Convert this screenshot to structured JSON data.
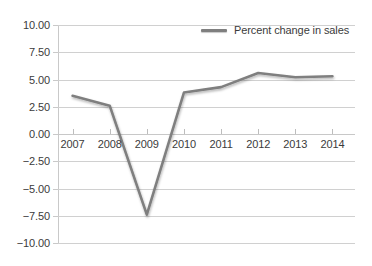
{
  "chart_data": {
    "type": "line",
    "title": "",
    "xlabel": "",
    "ylabel": "",
    "categories": [
      "2007",
      "2008",
      "2009",
      "2010",
      "2011",
      "2012",
      "2013",
      "2014"
    ],
    "series": [
      {
        "name": "Percent change in sales",
        "color": "#7f7f7f",
        "values": [
          3.5,
          2.6,
          -7.4,
          3.8,
          4.3,
          5.6,
          5.2,
          5.3
        ]
      }
    ],
    "ylim": [
      -10.0,
      10.0
    ],
    "ytick_step": 2.5,
    "ytick_labels": [
      "10.00",
      "7.50",
      "5.00",
      "2.50",
      "0.00",
      "-2.50",
      "-5.00",
      "-7.50",
      "-10.00"
    ],
    "ytick_values": [
      10.0,
      7.5,
      5.0,
      2.5,
      0.0,
      -2.5,
      -5.0,
      -7.5,
      -10.0
    ],
    "grid": true,
    "legend_position": "top-right",
    "legend_entries": [
      "Percent change in sales"
    ]
  },
  "legend": {
    "label": "Percent change in sales"
  },
  "colors": {
    "line": "#7f7f7f",
    "grid": "#d0d0d0",
    "text": "#3b3b3b",
    "background": "#ffffff"
  }
}
